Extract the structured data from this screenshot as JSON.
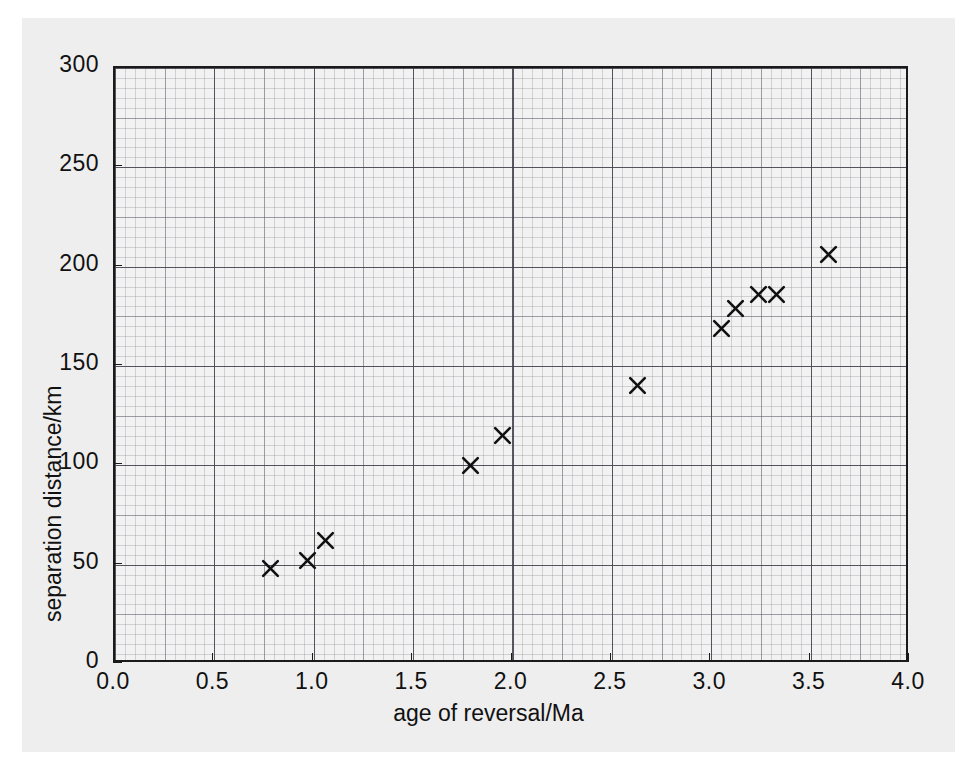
{
  "chart_data": {
    "type": "scatter",
    "title": "",
    "xlabel": "age of reversal/Ma",
    "ylabel": "separation distance/km",
    "xlim": [
      0.0,
      4.0
    ],
    "ylim": [
      0,
      300
    ],
    "grid": true,
    "legend": "none",
    "marker": "x",
    "marker_color": "#111111",
    "x_ticks": [
      "0.0",
      "0.5",
      "1.0",
      "1.5",
      "2.0",
      "2.5",
      "3.0",
      "3.5",
      "4.0"
    ],
    "x_tick_values": [
      0.0,
      0.5,
      1.0,
      1.5,
      2.0,
      2.5,
      3.0,
      3.5,
      4.0
    ],
    "y_ticks": [
      "0",
      "50",
      "100",
      "150",
      "200",
      "250",
      "300"
    ],
    "y_tick_values": [
      0,
      50,
      100,
      150,
      200,
      250,
      300
    ],
    "x": [
      0.78,
      0.97,
      1.06,
      1.79,
      1.95,
      2.63,
      3.05,
      3.12,
      3.24,
      3.33,
      3.59
    ],
    "y": [
      48,
      52,
      62,
      100,
      115,
      140,
      169,
      179,
      186,
      186,
      206
    ],
    "points": [
      {
        "x": 0.78,
        "y": 48
      },
      {
        "x": 0.97,
        "y": 52
      },
      {
        "x": 1.06,
        "y": 62
      },
      {
        "x": 1.79,
        "y": 100
      },
      {
        "x": 1.95,
        "y": 115
      },
      {
        "x": 2.63,
        "y": 140
      },
      {
        "x": 3.05,
        "y": 169
      },
      {
        "x": 3.12,
        "y": 179
      },
      {
        "x": 3.24,
        "y": 186
      },
      {
        "x": 3.33,
        "y": 186
      },
      {
        "x": 3.59,
        "y": 206
      }
    ]
  },
  "figure": {
    "background_color": "#eeeeee",
    "plot_background_color": "#f2f2f2",
    "axis_color": "#1a1a1a",
    "grid_color": "#787882"
  }
}
